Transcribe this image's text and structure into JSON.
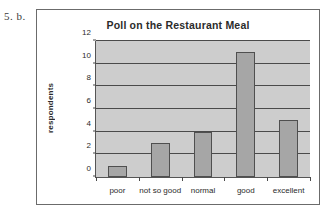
{
  "question_label": "5. b.",
  "chart_data": {
    "type": "bar",
    "title": "Poll on the Restaurant Meal",
    "xlabel": "",
    "ylabel": "respondents",
    "categories": [
      "poor",
      "not so good",
      "normal",
      "good",
      "excellent"
    ],
    "values": [
      1,
      3,
      4,
      11,
      5
    ],
    "ylim": [
      0,
      12
    ],
    "ytick_step": 2,
    "yticks": [
      0,
      2,
      4,
      6,
      8,
      10,
      12
    ],
    "ytick_labels": [
      "0",
      "2",
      "4",
      "6",
      "8",
      "10",
      "12"
    ],
    "grid": true,
    "legend": false,
    "colors": {
      "bar_fill": "#a6a6a6",
      "bar_border": "#4f4f4f",
      "plot_background": "#cdcdcd",
      "gridline": "#4a4a4a",
      "axis": "#555555",
      "frame": "#6b6b6b",
      "text": "#2b2b2b"
    }
  }
}
